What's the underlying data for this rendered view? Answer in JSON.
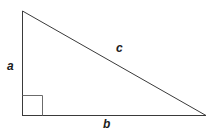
{
  "figure": {
    "name": "right-triangle-diagram",
    "background_color": "#ffffff",
    "stroke_color": "#3a3a3a",
    "stroke_width": 1,
    "label_color": "#1c1c1c",
    "vertices": {
      "top": {
        "x": 22,
        "y": 11
      },
      "bottom_left": {
        "x": 22,
        "y": 115
      },
      "bottom_right": {
        "x": 206,
        "y": 115
      }
    },
    "right_angle_marker": {
      "name": "right-angle-square",
      "x": 22,
      "y": 95,
      "size": 20
    },
    "labels": {
      "vertical_leg": "a",
      "horizontal_leg": "b",
      "hypotenuse": "c"
    }
  }
}
